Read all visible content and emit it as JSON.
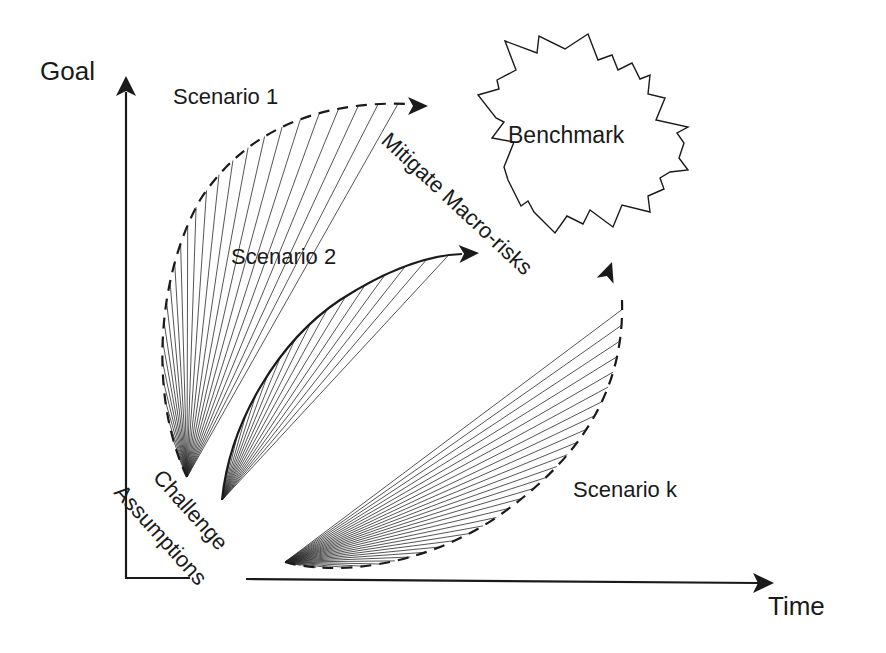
{
  "axes": {
    "y_label": "Goal",
    "x_label": "Time",
    "origin": [
      126,
      578
    ],
    "y_tip": [
      126,
      78
    ],
    "x_tip": [
      773,
      578
    ]
  },
  "labels": {
    "scenario_1": "Scenario 1",
    "scenario_2": "Scenario 2",
    "scenario_k": "Scenario k",
    "benchmark": "Benchmark",
    "mitigate": "Mitigate Macro-risks",
    "challenge_line1": "Challenge",
    "challenge_line2": "Assumptions"
  },
  "scenarios": [
    {
      "id": "scenario-1",
      "style": "dashed",
      "origin": [
        187,
        477
      ],
      "curve": "M187,477 C150,400 155,280 200,200 C245,130 320,100 410,104",
      "arrow_tip": [
        428,
        106
      ],
      "arrow_angle": 0,
      "fan_count": 26
    },
    {
      "id": "scenario-2",
      "style": "solid",
      "origin": [
        222,
        500
      ],
      "curve": "M222,500 C230,420 280,340 340,300 C390,268 430,255 462,254",
      "arrow_tip": [
        479,
        253
      ],
      "arrow_angle": -3,
      "fan_count": 16
    },
    {
      "id": "scenario-k",
      "style": "dashed",
      "origin": [
        285,
        562
      ],
      "curve": "M285,562 C330,575 420,570 500,515 C570,465 625,400 622,300",
      "arrow_tip": [
        612,
        262
      ],
      "arrow_angle": -70,
      "fan_count": 30
    }
  ],
  "benchmark_shape": {
    "center": [
      585,
      135
    ],
    "points": "505,41 537,53 539,36 565,49 588,34 598,60 612,55 618,70 632,63 640,79 650,75 648,94 665,98 656,120 688,127 677,133 684,143 679,158 688,170 670,172 660,178 664,189 648,196 650,212 622,205 613,227 590,210 583,224 567,216 555,233 534,212 528,201 521,206 508,180 504,167 514,142 492,138 504,122 496,118 478,95 499,89 497,80 516,70"
  },
  "colors": {
    "ink": "#1a1a1a",
    "background": "#ffffff"
  }
}
